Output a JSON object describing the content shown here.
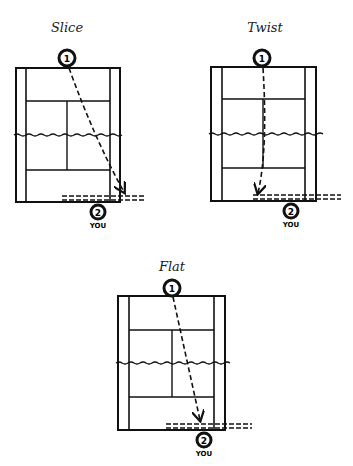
{
  "diagrams": [
    {
      "title": "Slice",
      "server_label": "1",
      "receiver_label": "2",
      "receiver_caption": "YOU",
      "title_pos": [
        67,
        20
      ],
      "court": {
        "left": 16,
        "right": 120,
        "top": 68,
        "bottom": 202,
        "inner_left": 26,
        "inner_right": 110,
        "service_top": 101,
        "net": 135,
        "service_bottom": 170,
        "center": 67
      },
      "server": [
        67,
        58
      ],
      "receiver": [
        98,
        212
      ],
      "path": "M69 68 Q95 140 124 192",
      "baseline_dash": {
        "x1": 62,
        "x2": 145,
        "y1": 196,
        "y2": 200
      }
    },
    {
      "title": "Twist",
      "server_label": "1",
      "receiver_label": "2",
      "receiver_caption": "YOU",
      "title_pos": [
        265,
        20
      ],
      "court": {
        "left": 211,
        "right": 316,
        "top": 67,
        "bottom": 201,
        "inner_left": 222,
        "inner_right": 305,
        "service_top": 99,
        "net": 134,
        "service_bottom": 168,
        "center": 263
      },
      "server": [
        262,
        58
      ],
      "receiver": [
        291,
        211
      ],
      "path": "M263 68 Q268 150 258 195",
      "baseline_dash": {
        "x1": 253,
        "x2": 341,
        "y1": 195,
        "y2": 199
      }
    },
    {
      "title": "Flat",
      "server_label": "1",
      "receiver_label": "2",
      "receiver_caption": "YOU",
      "title_pos": [
        172,
        259
      ],
      "court": {
        "left": 118,
        "right": 225,
        "top": 296,
        "bottom": 430,
        "inner_left": 129,
        "inner_right": 214,
        "service_top": 330,
        "net": 363,
        "service_bottom": 397,
        "center": 172
      },
      "server": [
        172,
        288
      ],
      "receiver": [
        204,
        440
      ],
      "path": "M173 297 L200 422",
      "baseline_dash": {
        "x1": 166,
        "x2": 252,
        "y1": 424,
        "y2": 428
      }
    }
  ],
  "colors": {
    "ink": "#111111",
    "background": "#ffffff"
  }
}
